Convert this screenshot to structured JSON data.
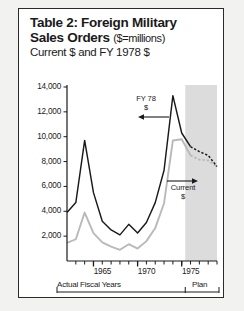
{
  "figure": {
    "title_line1": "Table 2: Foreign Military",
    "title_line2_bold": "Sales Orders",
    "title_line2_sub": "($=millions)",
    "title_line3": "Current $ and FY 1978 $"
  },
  "annotations": {
    "series_dark_label_line1": "FY 78",
    "series_dark_label_line2": "$",
    "series_light_label_line1": "Current",
    "series_light_label_line2": "$",
    "actual_label": "Actual Fiscal Years",
    "plan_label": "Plan"
  },
  "colors": {
    "dark_series": "#1a1a1a",
    "light_series": "#b9b9b9",
    "plan_shade": "#dcdcdc",
    "axis": "#1a1a1a",
    "frame": "#2b2b2b",
    "background": "#ffffff"
  },
  "chart_data": {
    "type": "line",
    "title": "Table 2: Foreign Military Sales Orders ($=millions)",
    "subtitle": "Current $ and FY 1978 $",
    "xlabel": "Actual Fiscal Years",
    "ylabel": "",
    "ylim": [
      0,
      14000
    ],
    "xlim": [
      1962,
      1979
    ],
    "grid": false,
    "legend_position": "inline-annotation",
    "ytick_labels": [
      "2,000",
      "4,000",
      "6,000",
      "8,000",
      "10,000",
      "12,000",
      "14,000"
    ],
    "ytick_values": [
      2000,
      4000,
      6000,
      8000,
      10000,
      12000,
      14000
    ],
    "xtick_labels": [
      "1965",
      "1970",
      "1975"
    ],
    "xtick_values": [
      1965,
      1970,
      1975
    ],
    "x": [
      1962,
      1963,
      1964,
      1965,
      1966,
      1967,
      1968,
      1969,
      1970,
      1971,
      1972,
      1973,
      1974,
      1975,
      1976,
      1977,
      1978,
      1979
    ],
    "series": [
      {
        "name": "FY 78 $",
        "color": "#1a1a1a",
        "style": "solid",
        "forecast_from_index": 14,
        "values": [
          3900,
          4700,
          9700,
          5500,
          3200,
          2500,
          2100,
          2950,
          2250,
          3100,
          4700,
          7300,
          13300,
          10300,
          9200,
          8800,
          8500,
          7600
        ]
      },
      {
        "name": "Current $",
        "color": "#b9b9b9",
        "style": "solid",
        "forecast_from_index": 14,
        "values": [
          1450,
          1750,
          3900,
          2250,
          1500,
          1150,
          900,
          1350,
          1000,
          1600,
          2650,
          4650,
          9700,
          9800,
          8500,
          8150,
          8100,
          7600
        ]
      }
    ],
    "shaded_region": {
      "label": "Plan",
      "x_start": 1975.4,
      "x_end": 1979
    }
  }
}
